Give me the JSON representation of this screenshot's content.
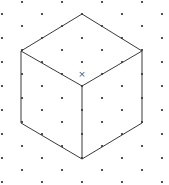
{
  "diagram": {
    "colors": {
      "background": "#ffffff",
      "dot": "#2a2a2a",
      "edge": "#3a3a3a",
      "marker": "#555555"
    },
    "grid": {
      "dx": 20,
      "dy": 12,
      "origin_x": 2,
      "origin_y": 14,
      "rows": 15,
      "cols": 9
    },
    "cube": {
      "vertices": {
        "top": [
          82,
          14
        ],
        "upper_left": [
          21,
          51
        ],
        "upper_right": [
          142,
          51
        ],
        "center": [
          82,
          86
        ],
        "lower_left": [
          21,
          123
        ],
        "lower_right": [
          142,
          123
        ],
        "bottom": [
          82,
          159
        ]
      },
      "edges": [
        [
          "top",
          "upper_left"
        ],
        [
          "top",
          "upper_right"
        ],
        [
          "upper_left",
          "center"
        ],
        [
          "upper_right",
          "center"
        ],
        [
          "upper_left",
          "lower_left"
        ],
        [
          "upper_right",
          "lower_right"
        ],
        [
          "center",
          "bottom"
        ],
        [
          "lower_left",
          "bottom"
        ],
        [
          "lower_right",
          "bottom"
        ]
      ]
    },
    "center_marker": {
      "symbol": "×",
      "x": 82,
      "y": 74
    }
  }
}
